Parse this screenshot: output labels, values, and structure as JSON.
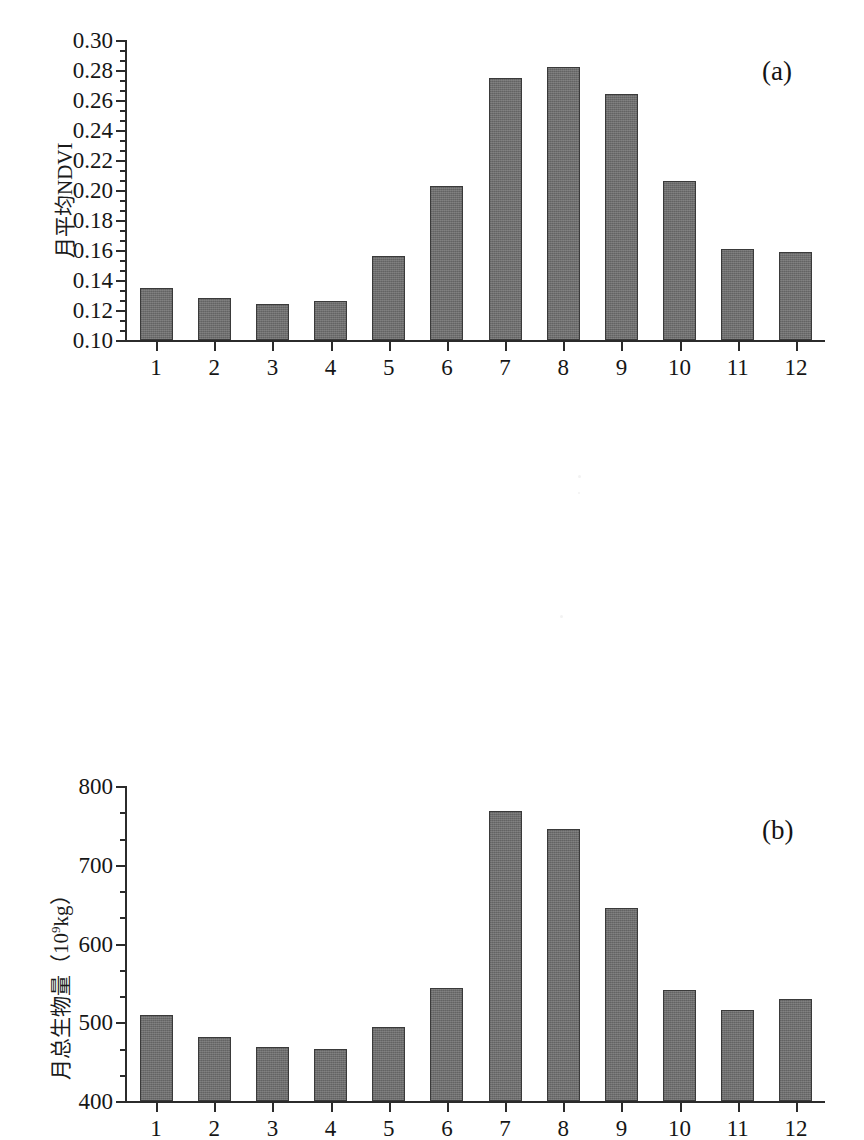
{
  "figure": {
    "background": "#ffffff",
    "bar_color": "#6e6e6e",
    "axis_color": "#2b2b2b"
  },
  "panels": [
    {
      "letter": "(a)",
      "ylabel": "月平均NDVI",
      "ylabel_sup": "",
      "ymin": 0.1,
      "ymax": 0.3,
      "ytick_labels": [
        "0.30",
        "0.28",
        "0.26",
        "0.24",
        "0.22",
        "0.20",
        "0.18",
        "0.16",
        "0.14",
        "0.12",
        "0.10"
      ],
      "xtick_labels": [
        "1",
        "2",
        "3",
        "4",
        "5",
        "6",
        "7",
        "8",
        "9",
        "10",
        "11",
        "12"
      ]
    },
    {
      "letter": "(b)",
      "ylabel_pre": "月总生物量（10",
      "ylabel_sup": "9",
      "ylabel_post": "kg）",
      "ymin": 400,
      "ymax": 800,
      "ytick_labels": [
        "800",
        "700",
        "600",
        "500",
        "400"
      ],
      "xtick_labels": [
        "1",
        "2",
        "3",
        "4",
        "5",
        "6",
        "7",
        "8",
        "9",
        "10",
        "11",
        "12"
      ]
    }
  ],
  "chart_data": [
    {
      "type": "bar",
      "panel": "(a)",
      "title": "",
      "xlabel": "",
      "ylabel": "月平均NDVI",
      "categories": [
        "1",
        "2",
        "3",
        "4",
        "5",
        "6",
        "7",
        "8",
        "9",
        "10",
        "11",
        "12"
      ],
      "values": [
        0.135,
        0.128,
        0.124,
        0.126,
        0.156,
        0.203,
        0.275,
        0.282,
        0.264,
        0.206,
        0.161,
        0.159
      ],
      "ylim": [
        0.1,
        0.3
      ],
      "ytick_step": 0.02,
      "minor_ticks_per_interval": 2,
      "grid": false,
      "legend": "none"
    },
    {
      "type": "bar",
      "panel": "(b)",
      "title": "",
      "xlabel": "",
      "ylabel": "月总生物量（10^9 kg）",
      "categories": [
        "1",
        "2",
        "3",
        "4",
        "5",
        "6",
        "7",
        "8",
        "9",
        "10",
        "11",
        "12"
      ],
      "values": [
        509,
        481,
        469,
        466,
        494,
        543,
        768,
        745,
        645,
        541,
        516,
        529
      ],
      "ylim": [
        400,
        800
      ],
      "ytick_step": 100,
      "minor_ticks_per_interval": 2,
      "grid": false,
      "legend": "none"
    }
  ]
}
